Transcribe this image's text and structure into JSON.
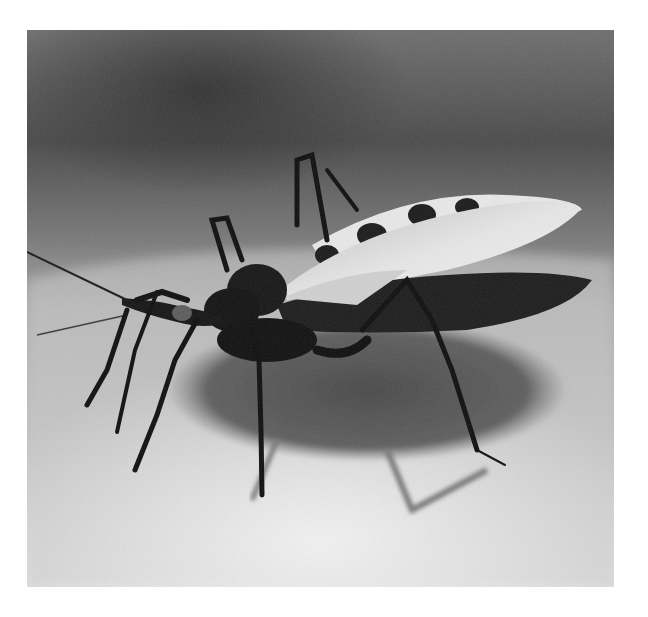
{
  "image": {
    "subject": "kissing bug (triatomine insect) standing on skin",
    "style": "black and white photograph",
    "alt": "Close-up black and white photo of a kissing bug with long legs and striped abdomen edge casting a shadow on skin",
    "colors": {
      "page_background": "#ffffff",
      "background_dark": "#3a3a3a",
      "background_mid": "#8a8a8a",
      "skin_light": "#dcdcdc",
      "shadow": "#5a5a5a",
      "insect_body": "#141414",
      "wing": "#d8d8d8"
    }
  }
}
